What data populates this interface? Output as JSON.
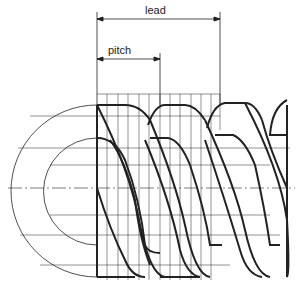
{
  "diagram": {
    "labels": {
      "lead": "lead",
      "pitch": "pitch"
    },
    "dimensions": {
      "lead": {
        "x_start": 97,
        "x_end": 220,
        "y": 19
      },
      "pitch": {
        "x_start": 97,
        "x_end": 160,
        "y": 59
      }
    },
    "colors": {
      "line": "#1a1a1a",
      "background": "#ffffff"
    }
  }
}
